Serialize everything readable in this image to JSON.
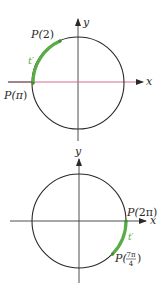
{
  "colors": {
    "axis": "#3a3a3a",
    "x_axis_top": "#d86a8a",
    "circle": "#2a2a2a",
    "arc": "#5aac46",
    "label": "#2a2a2a",
    "background": "#ffffff"
  },
  "diagrams": [
    {
      "id": "top",
      "x_axis_label": "x",
      "y_axis_label": "y",
      "arc_label": "t′",
      "points": [
        {
          "label_prefix": "P(",
          "arg": "2",
          "label_suffix": ")"
        },
        {
          "label_prefix": "P(",
          "arg": "π",
          "label_suffix": ")"
        }
      ]
    },
    {
      "id": "bottom",
      "x_axis_label": "x",
      "y_axis_label": "y",
      "arc_label": "t′",
      "points": [
        {
          "label_prefix": "P(",
          "arg": "2π",
          "label_suffix": ")"
        },
        {
          "label_prefix": "P(",
          "arg_num": "7π",
          "arg_den": "4",
          "label_suffix": ")"
        }
      ]
    }
  ]
}
